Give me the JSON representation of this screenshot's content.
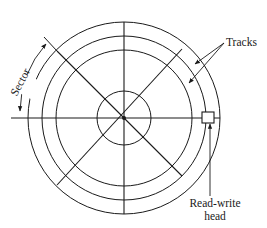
{
  "diagram": {
    "colors": {
      "line": "#1a1a1a",
      "background": "#ffffff"
    },
    "disk": {
      "center": [
        124,
        118
      ],
      "track_radii": [
        96,
        82,
        68
      ],
      "hub_radius": 27,
      "radial_lines": 8
    },
    "labels": {
      "tracks": "Tracks",
      "sector": "Sector",
      "head_line1": "Read-write",
      "head_line2": "head"
    }
  }
}
